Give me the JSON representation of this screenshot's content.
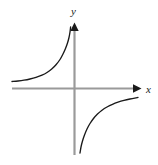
{
  "figure": {
    "name": "hyperbola-graph",
    "width": 158,
    "height": 165,
    "background_color": "#ffffff",
    "axis_color": "#9a9a9a",
    "curve_color": "#1a1a1a",
    "arrow_color": "#1a1a1a",
    "label_color": "#1a1a1a"
  },
  "labels": {
    "x_axis": "x",
    "y_axis": "y"
  },
  "icons": {
    "x_arrow": "arrow-right-icon",
    "y_arrow": "arrow-up-icon"
  },
  "chart_data": {
    "type": "line",
    "title": "",
    "subtitle": "",
    "xlabel": "x",
    "ylabel": "y",
    "grid": false,
    "legend": null,
    "axis_style": {
      "x_axis_y_pixel": 88.5,
      "y_axis_x_pixel": 74.5,
      "x_axis_start_pixel": 12,
      "x_axis_end_pixel": 140,
      "y_axis_top_pixel": 24,
      "y_axis_bottom_pixel": 155,
      "arrowheads": [
        "x-positive",
        "y-positive"
      ],
      "ticks": [],
      "tick_labels": []
    },
    "xlim": [
      -5.0,
      4.4
    ],
    "ylim": [
      -5.0,
      4.7
    ],
    "equation": "y = -k / x",
    "series": [
      {
        "name": "upper-left-branch",
        "quadrant": "II",
        "points_pixel": [
          [
            12,
            81.5
          ],
          [
            18,
            81.0
          ],
          [
            24,
            80.2
          ],
          [
            30,
            79.0
          ],
          [
            36,
            77.4
          ],
          [
            42,
            75.2
          ],
          [
            47,
            72.5
          ],
          [
            52,
            68.8
          ],
          [
            56,
            64.8
          ],
          [
            60,
            59.5
          ],
          [
            63,
            54.0
          ],
          [
            65.5,
            48.5
          ],
          [
            67.5,
            43.0
          ],
          [
            69,
            37.5
          ],
          [
            70,
            32.0
          ],
          [
            70.6,
            27.0
          ]
        ],
        "points_data": [
          [
            -4.6,
            0.26
          ],
          [
            -4.1,
            0.28
          ],
          [
            -3.7,
            0.3
          ],
          [
            -3.3,
            0.34
          ],
          [
            -2.8,
            0.4
          ],
          [
            -2.4,
            0.48
          ],
          [
            -2.0,
            0.57
          ],
          [
            -1.6,
            0.71
          ],
          [
            -1.35,
            0.85
          ],
          [
            -1.05,
            1.04
          ],
          [
            -0.83,
            1.24
          ],
          [
            -0.66,
            1.43
          ],
          [
            -0.52,
            1.63
          ],
          [
            -0.4,
            1.83
          ],
          [
            -0.32,
            2.02
          ],
          [
            -0.28,
            2.2
          ]
        ]
      },
      {
        "name": "lower-right-branch",
        "quadrant": "IV",
        "points_pixel": [
          [
            80.0,
            153.0
          ],
          [
            81.0,
            147.0
          ],
          [
            82.5,
            141.0
          ],
          [
            84.5,
            135.0
          ],
          [
            87.0,
            129.0
          ],
          [
            90.0,
            123.5
          ],
          [
            93.5,
            118.5
          ],
          [
            97.5,
            114.0
          ],
          [
            102.0,
            110.2
          ],
          [
            107.0,
            107.0
          ],
          [
            112.5,
            104.3
          ],
          [
            118.0,
            102.2
          ],
          [
            124.0,
            100.4
          ],
          [
            130.0,
            99.0
          ],
          [
            138.0,
            97.4
          ]
        ],
        "points_data": [
          [
            0.2,
            -2.32
          ],
          [
            0.24,
            -2.11
          ],
          [
            0.29,
            -1.89
          ],
          [
            0.37,
            -1.68
          ],
          [
            0.46,
            -1.46
          ],
          [
            0.57,
            -1.26
          ],
          [
            0.69,
            -1.08
          ],
          [
            0.84,
            -0.92
          ],
          [
            1.0,
            -0.78
          ],
          [
            1.18,
            -0.67
          ],
          [
            1.38,
            -0.57
          ],
          [
            1.58,
            -0.49
          ],
          [
            1.8,
            -0.43
          ],
          [
            2.01,
            -0.38
          ],
          [
            2.3,
            -0.32
          ]
        ]
      }
    ]
  }
}
